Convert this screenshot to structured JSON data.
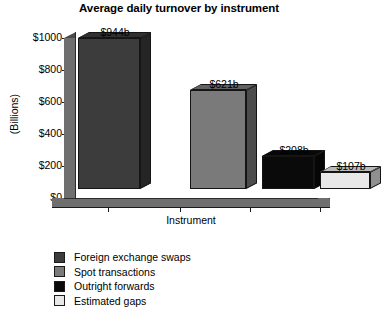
{
  "chart_data": {
    "type": "bar",
    "title": "Average daily turnover by instrument",
    "xlabel": "Instrument",
    "ylabel": "(Billions)",
    "categories": [
      "Foreign exchange swaps",
      "Spot transactions",
      "Outright forwards",
      "Estimated gaps"
    ],
    "values": [
      944,
      621,
      208,
      107
    ],
    "data_labels": [
      "$944b",
      "$621b",
      "$208b",
      "$107b"
    ],
    "ylim": [
      0,
      1000
    ],
    "ytick_values": [
      0,
      200,
      400,
      600,
      800,
      1000
    ],
    "ytick_labels": [
      "$0",
      "$200",
      "$400",
      "$600",
      "$800",
      "$1000"
    ],
    "grid": false,
    "legend_position": "bottom-left",
    "style": "3d-bar",
    "colors": {
      "foreign_exchange_swaps": "#3c3c3c",
      "spot_transactions": "#7a7a7a",
      "outright_forwards": "#0a0a0a",
      "estimated_gaps": "#e8e8e8",
      "axis": "#1a1a1a",
      "wall": "#6f6f6f",
      "background": "#ffffff"
    }
  },
  "legend": {
    "items": [
      {
        "label": "Foreign exchange swaps",
        "color": "#3c3c3c"
      },
      {
        "label": "Spot transactions",
        "color": "#7a7a7a"
      },
      {
        "label": "Outright forwards",
        "color": "#0a0a0a"
      },
      {
        "label": "Estimated gaps",
        "color": "#e8e8e8"
      }
    ]
  }
}
